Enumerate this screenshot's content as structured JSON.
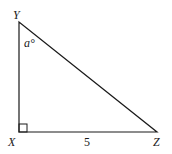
{
  "diagram": {
    "type": "right-triangle",
    "vertices": {
      "Y": {
        "label": "Y"
      },
      "X": {
        "label": "X"
      },
      "Z": {
        "label": "Z"
      }
    },
    "angle_label": "a°",
    "angle_at": "Y",
    "right_angle_at": "X",
    "side_XZ_label": "5",
    "colors": {
      "stroke": "#1a1a1a",
      "background": "#ffffff"
    }
  }
}
